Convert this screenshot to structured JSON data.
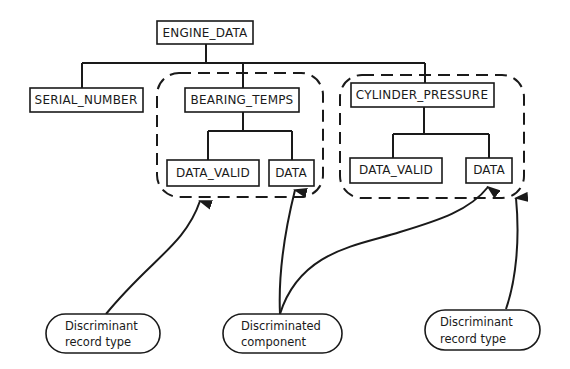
{
  "diagram": {
    "type": "hierarchy",
    "root": {
      "label": "ENGINE_DATA"
    },
    "children": [
      {
        "label": "SERIAL_NUMBER"
      },
      {
        "label": "BEARING_TEMPS",
        "grouped": true,
        "children": [
          {
            "label": "DATA_VALID"
          },
          {
            "label": "DATA"
          }
        ]
      },
      {
        "label": "CYLINDER_PRESSURE",
        "grouped": true,
        "children": [
          {
            "label": "DATA_VALID"
          },
          {
            "label": "DATA"
          }
        ]
      }
    ],
    "callouts": [
      {
        "line1": "Discriminant",
        "line2": "record type",
        "points_to": "BEARING_TEMPS group"
      },
      {
        "line1": "Discriminated",
        "line2": "component",
        "points_to": [
          "BEARING_TEMPS.DATA",
          "CYLINDER_PRESSURE.DATA"
        ]
      },
      {
        "line1": "Discriminant",
        "line2": "record type",
        "points_to": "CYLINDER_PRESSURE group"
      }
    ],
    "colors": {
      "ink": "#1a1a1a",
      "background": "#ffffff"
    }
  }
}
